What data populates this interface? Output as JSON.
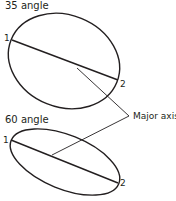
{
  "diagram": {
    "top": {
      "title": "35 angle",
      "point1": "1",
      "point2": "2"
    },
    "bottom": {
      "title": "60 angle",
      "point1": "1",
      "point2": "2"
    },
    "callout": "Major axis",
    "colors": {
      "stroke": "#231f20",
      "background": "#ffffff"
    }
  }
}
